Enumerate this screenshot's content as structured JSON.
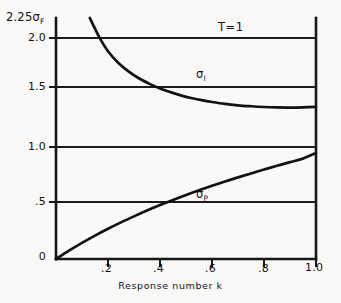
{
  "chart_data": {
    "type": "line",
    "title": "",
    "xlabel": "Response number k",
    "ylabel": "2.25σ",
    "ylabel_sub": "F",
    "xlim": [
      0.0,
      1.0
    ],
    "ylim": [
      0.0,
      2.25
    ],
    "grid": true,
    "grid_lines_y": [
      0.5,
      1.0,
      1.5,
      2.0
    ],
    "legend": "inline-annotations",
    "x_ticks": [
      {
        "value": 0.2,
        "label": ".2"
      },
      {
        "value": 0.4,
        "label": ".4"
      },
      {
        "value": 0.6,
        "label": ".6"
      },
      {
        "value": 0.8,
        "label": ".8"
      },
      {
        "value": 1.0,
        "label": "1.0"
      }
    ],
    "y_ticks": [
      {
        "value": 0.0,
        "label": "0"
      },
      {
        "value": 0.5,
        "label": ".5"
      },
      {
        "value": 1.0,
        "label": "1.0"
      },
      {
        "value": 1.5,
        "label": "1.5"
      },
      {
        "value": 2.0,
        "label": "2.0"
      },
      {
        "value": 2.25,
        "label": "2.25σ"
      }
    ],
    "annotations": [
      {
        "name": "temperature",
        "text": "T=1",
        "x": 0.72,
        "y": 2.1
      },
      {
        "name": "sigma-I-label",
        "text": "σ",
        "sub": "I",
        "x": 0.56,
        "y": 1.66
      },
      {
        "name": "sigma-P-label",
        "text": "σ",
        "sub": "P",
        "x": 0.56,
        "y": 0.58
      }
    ],
    "series": [
      {
        "name": "σ_I",
        "sub": "I",
        "color": "#121214",
        "x": [
          0.13,
          0.15,
          0.17,
          0.2,
          0.24,
          0.28,
          0.32,
          0.36,
          0.4,
          0.44,
          0.48,
          0.52,
          0.56,
          0.6,
          0.65,
          0.7,
          0.75,
          0.8,
          0.85,
          0.9,
          0.95,
          1.0
        ],
        "y": [
          2.25,
          2.15,
          2.055,
          1.94,
          1.83,
          1.75,
          1.685,
          1.635,
          1.592,
          1.558,
          1.528,
          1.503,
          1.483,
          1.466,
          1.448,
          1.435,
          1.426,
          1.419,
          1.415,
          1.414,
          1.416,
          1.42
        ]
      },
      {
        "name": "σ_P",
        "sub": "P",
        "color": "#121214",
        "x": [
          0.0,
          0.05,
          0.1,
          0.15,
          0.2,
          0.25,
          0.3,
          0.35,
          0.4,
          0.45,
          0.5,
          0.55,
          0.6,
          0.65,
          0.7,
          0.75,
          0.8,
          0.85,
          0.9,
          0.95,
          1.0
        ],
        "y": [
          0.0,
          0.078,
          0.15,
          0.218,
          0.282,
          0.342,
          0.398,
          0.452,
          0.503,
          0.551,
          0.597,
          0.641,
          0.683,
          0.723,
          0.762,
          0.799,
          0.835,
          0.87,
          0.904,
          0.937,
          0.99
        ]
      }
    ]
  },
  "labels": {
    "top_sigma_main": "2.25σ",
    "top_sigma_sub": "F",
    "y_2_0": "2.0",
    "y_1_5": "1.5",
    "y_1_0": "1.0",
    "y_0_5": ".5",
    "y_0": "0",
    "x_0_2": ".2",
    "x_0_4": ".4",
    "x_0_6": ".6",
    "x_0_8": ".8",
    "x_1_0": "1.0",
    "xaxis_title": "Response number k",
    "annotation_T": "T=1",
    "sigma_I_main": "σ",
    "sigma_I_sub": "I",
    "sigma_P_main": "σ",
    "sigma_P_sub": "P"
  },
  "colors": {
    "background": "#faf9f7",
    "axis": "#17171a",
    "curve": "#121214",
    "text": "#111113"
  }
}
